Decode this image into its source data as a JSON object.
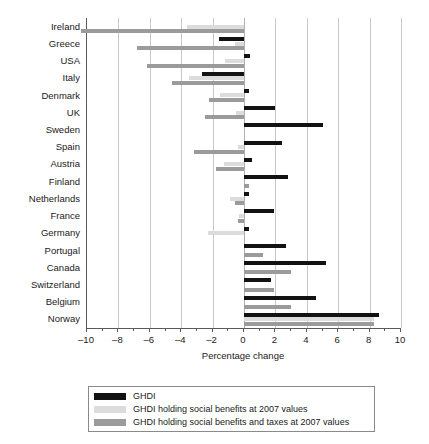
{
  "chart_data": {
    "type": "bar",
    "orientation": "horizontal",
    "title": "",
    "xlabel": "Percentage change",
    "ylabel": "",
    "xlim": [
      -10,
      10
    ],
    "xticks": [
      -10,
      -8,
      -6,
      -4,
      -2,
      0,
      2,
      4,
      6,
      8,
      10
    ],
    "xticklabels": [
      "–10",
      "–8",
      "–6",
      "–4",
      "–2",
      "0",
      "2",
      "4",
      "6",
      "8",
      "10"
    ],
    "grid": true,
    "grid_axis": "x",
    "legend_position": "below",
    "categories": [
      "Ireland",
      "Greece",
      "USA",
      "Italy",
      "Denmark",
      "UK",
      "Sweden",
      "Spain",
      "Austria",
      "Finland",
      "Netherlands",
      "France",
      "Germany",
      "Portugal",
      "Canada",
      "Switzerland",
      "Belgium",
      "Norway"
    ],
    "series": [
      {
        "name": "GHDI",
        "color": "#121212",
        "values": [
          0.0,
          -1.6,
          0.4,
          -2.7,
          0.35,
          2.0,
          5.0,
          2.4,
          0.5,
          2.8,
          0.35,
          1.9,
          0.3,
          2.7,
          5.2,
          1.7,
          4.6,
          8.6
        ]
      },
      {
        "name": "GHDI holding social benefits at 2007 values",
        "color": "#dcdcdc",
        "values": [
          -3.6,
          -0.6,
          -1.2,
          -3.5,
          -1.5,
          -0.5,
          0.0,
          -0.4,
          -1.3,
          0.0,
          -0.9,
          -0.3,
          -2.3,
          0.0,
          0.0,
          0.0,
          0.0,
          8.3
        ]
      },
      {
        "name": "GHDI holding social benefits and taxes at 2007 values",
        "color": "#9b9b9b",
        "values": [
          -10.4,
          -6.8,
          -6.2,
          -4.6,
          -2.2,
          -2.5,
          0.0,
          -3.2,
          -1.8,
          0.3,
          -0.6,
          -0.4,
          0.0,
          1.2,
          3.0,
          1.9,
          3.0,
          8.3
        ]
      }
    ]
  },
  "legend": {
    "entries": [
      {
        "label": "GHDI"
      },
      {
        "label": "GHDI holding social benefits at 2007 values"
      },
      {
        "label": "GHDI holding social benefits and taxes at 2007 values"
      }
    ]
  }
}
